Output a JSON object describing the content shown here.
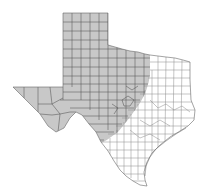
{
  "map": {
    "subject": "Texas counties",
    "highlighted_region": "Western Texas (Panhandle, West Texas, Trans-Pecos, Hill Country edge)",
    "colors": {
      "background": "#ffffff",
      "highlight_fill": "#c8c8c8",
      "unhighlighted_fill": "#ffffff",
      "highlight_county_line": "#555555",
      "unhighlighted_county_line": "#8a8a8a",
      "outline": "#666666"
    }
  }
}
